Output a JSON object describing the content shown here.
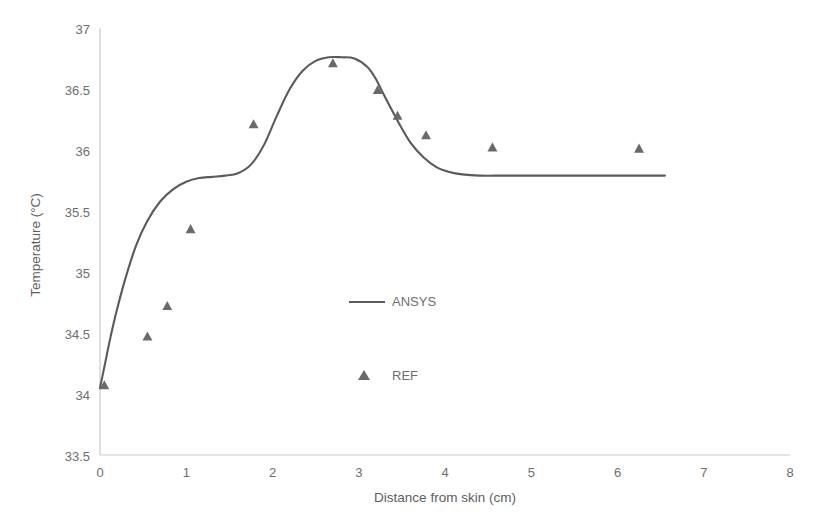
{
  "chart_data": {
    "type": "line",
    "title": "",
    "xlabel": "Distance from skin (cm)",
    "ylabel": "Temperature (°C)",
    "xlim": [
      0,
      8
    ],
    "ylim": [
      33.5,
      37
    ],
    "xticks": [
      "0",
      "1",
      "2",
      "3",
      "4",
      "5",
      "6",
      "7",
      "8"
    ],
    "yticks": [
      "33.5",
      "34",
      "34.5",
      "35",
      "35.5",
      "36",
      "36.5",
      "37"
    ],
    "xtick_values": [
      0,
      1,
      2,
      3,
      4,
      5,
      6,
      7,
      8
    ],
    "ytick_values": [
      33.5,
      34,
      34.5,
      35,
      35.5,
      36,
      36.5,
      37
    ],
    "grid": false,
    "legend_position": "center",
    "line_color": "#5a5a5a",
    "marker_color": "#6a6a6a",
    "axis_color": "#c9c9c9",
    "series": [
      {
        "name": "ANSYS",
        "type": "line",
        "x": [
          0.0,
          0.05,
          0.12,
          0.2,
          0.3,
          0.42,
          0.55,
          0.7,
          0.85,
          1.0,
          1.15,
          1.3,
          1.45,
          1.6,
          1.75,
          1.9,
          2.05,
          2.2,
          2.35,
          2.5,
          2.65,
          2.8,
          2.95,
          3.1,
          3.2,
          3.3,
          3.45,
          3.6,
          3.75,
          3.9,
          4.05,
          4.2,
          4.4,
          4.7,
          5.1,
          5.6,
          6.1,
          6.55
        ],
        "y": [
          34.05,
          34.22,
          34.46,
          34.7,
          34.96,
          35.22,
          35.42,
          35.58,
          35.68,
          35.74,
          35.77,
          35.78,
          35.79,
          35.81,
          35.88,
          36.04,
          36.28,
          36.5,
          36.65,
          36.73,
          36.76,
          36.76,
          36.75,
          36.68,
          36.58,
          36.44,
          36.24,
          36.06,
          35.94,
          35.86,
          35.82,
          35.8,
          35.79,
          35.79,
          35.79,
          35.79,
          35.79,
          35.79
        ]
      },
      {
        "name": "REF",
        "type": "scatter",
        "x": [
          0.05,
          0.55,
          0.78,
          1.05,
          1.78,
          2.7,
          3.22,
          3.45,
          3.78,
          4.55,
          6.25
        ],
        "y": [
          34.07,
          34.47,
          34.72,
          35.35,
          36.21,
          36.71,
          36.49,
          36.28,
          36.12,
          36.02,
          36.01
        ]
      }
    ],
    "legend": [
      {
        "label": "ANSYS",
        "symbol": "line"
      },
      {
        "label": "REF",
        "symbol": "triangle"
      }
    ]
  }
}
